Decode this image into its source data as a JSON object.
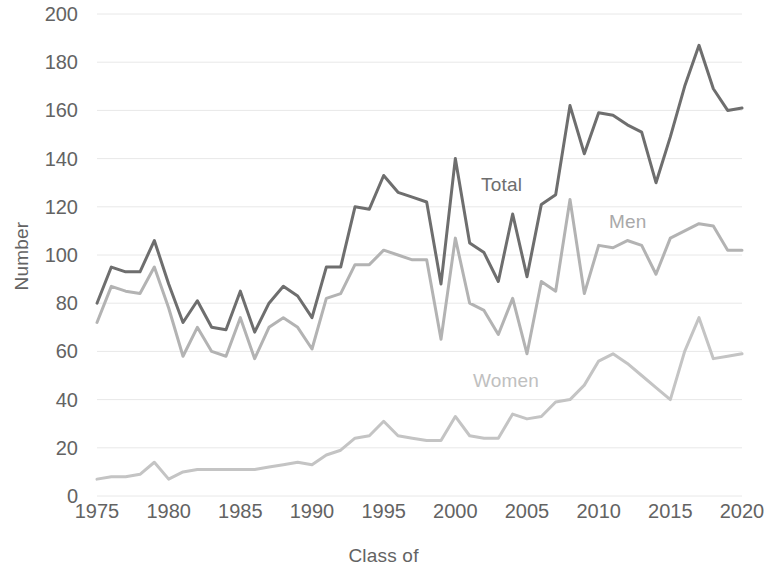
{
  "chart_data": {
    "type": "line",
    "title": "",
    "xlabel": "Class of",
    "ylabel": "Number",
    "xlim": [
      1975,
      2020
    ],
    "ylim": [
      0,
      200
    ],
    "grid": true,
    "grid_axis": "y",
    "legend": "inline-labels",
    "x": [
      1975,
      1976,
      1977,
      1978,
      1979,
      1980,
      1981,
      1982,
      1983,
      1984,
      1985,
      1986,
      1987,
      1988,
      1989,
      1990,
      1991,
      1992,
      1993,
      1994,
      1995,
      1996,
      1997,
      1998,
      1999,
      2000,
      2001,
      2002,
      2003,
      2004,
      2005,
      2006,
      2007,
      2008,
      2009,
      2010,
      2011,
      2012,
      2013,
      2014,
      2015,
      2016,
      2017,
      2018,
      2019,
      2020
    ],
    "xticks": [
      1975,
      1980,
      1985,
      1990,
      1995,
      2000,
      2005,
      2010,
      2015,
      2020
    ],
    "yticks": [
      0,
      20,
      40,
      60,
      80,
      100,
      120,
      140,
      160,
      180,
      200
    ],
    "series": [
      {
        "name": "Total",
        "color": "#6e6e6e",
        "width": 3,
        "values": [
          80,
          95,
          93,
          93,
          106,
          88,
          72,
          81,
          70,
          69,
          85,
          68,
          80,
          87,
          83,
          74,
          95,
          95,
          120,
          119,
          133,
          126,
          124,
          122,
          88,
          140,
          105,
          101,
          89,
          117,
          91,
          121,
          125,
          162,
          142,
          159,
          158,
          154,
          151,
          130,
          149,
          170,
          187,
          169,
          160,
          161
        ]
      },
      {
        "name": "Men",
        "color": "#b3b3b3",
        "width": 3,
        "values": [
          72,
          87,
          85,
          84,
          95,
          78,
          58,
          70,
          60,
          58,
          74,
          57,
          70,
          74,
          70,
          61,
          82,
          84,
          96,
          96,
          102,
          100,
          98,
          98,
          65,
          107,
          80,
          77,
          67,
          82,
          59,
          89,
          85,
          123,
          84,
          104,
          103,
          106,
          104,
          92,
          107,
          110,
          113,
          112,
          102,
          102
        ]
      },
      {
        "name": "Women",
        "color": "#c4c4c4",
        "width": 3,
        "values": [
          7,
          8,
          8,
          9,
          14,
          7,
          10,
          11,
          11,
          11,
          11,
          11,
          12,
          13,
          14,
          13,
          17,
          19,
          24,
          25,
          31,
          25,
          24,
          23,
          23,
          33,
          25,
          24,
          24,
          34,
          32,
          33,
          39,
          40,
          46,
          56,
          59,
          55,
          50,
          45,
          40,
          60,
          74,
          57,
          58,
          59
        ]
      }
    ]
  },
  "axes": {
    "y_title": "Number",
    "x_title": "Class of",
    "y_tick_labels": [
      "200",
      "180",
      "160",
      "140",
      "120",
      "100",
      "80",
      "60",
      "40",
      "20",
      "0"
    ],
    "x_tick_labels": [
      "1975",
      "1980",
      "1985",
      "1990",
      "1995",
      "2000",
      "2005",
      "2010",
      "2015",
      "2020"
    ]
  },
  "labels": {
    "total": "Total",
    "men": "Men",
    "women": "Women"
  },
  "colors": {
    "total": "#6e6e6e",
    "men": "#b3b3b3",
    "women": "#c4c4c4",
    "grid": "#e8e8e8",
    "text": "#636363",
    "background": "#ffffff"
  }
}
